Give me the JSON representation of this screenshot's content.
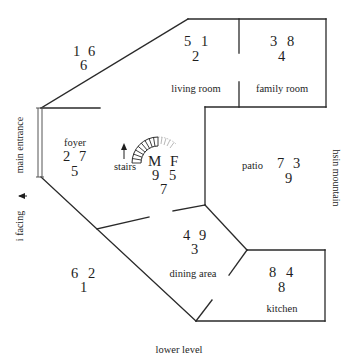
{
  "title": "lower level",
  "side_labels": {
    "left_top": "main entrance",
    "left_bottom": "i facing",
    "right": "hsin mountain"
  },
  "rooms": [
    {
      "name": "outside_top_left",
      "label": "",
      "numbers": [
        "1",
        "6",
        "6"
      ]
    },
    {
      "name": "living_room",
      "label": "living room",
      "numbers": [
        "5",
        "1",
        "2"
      ]
    },
    {
      "name": "family_room",
      "label": "family room",
      "numbers": [
        "3",
        "8",
        "4"
      ]
    },
    {
      "name": "foyer",
      "label": "foyer",
      "numbers": [
        "2",
        "7",
        "5"
      ]
    },
    {
      "name": "stairs",
      "label": "stairs",
      "markers": [
        "M",
        "F"
      ],
      "numbers": [
        "9",
        "5",
        "7"
      ]
    },
    {
      "name": "patio",
      "label": "patio",
      "numbers": [
        "7",
        "3",
        "9"
      ]
    },
    {
      "name": "dining_area",
      "label": "dining area",
      "numbers": [
        "4",
        "9",
        "3"
      ]
    },
    {
      "name": "outside_bottom_left",
      "label": "",
      "numbers": [
        "6",
        "2",
        "1"
      ]
    },
    {
      "name": "kitchen",
      "label": "kitchen",
      "numbers": [
        "8",
        "4",
        "8"
      ]
    }
  ],
  "colors": {
    "line": "#2a2a2a",
    "text": "#1e1e1e",
    "background": "#ffffff"
  }
}
